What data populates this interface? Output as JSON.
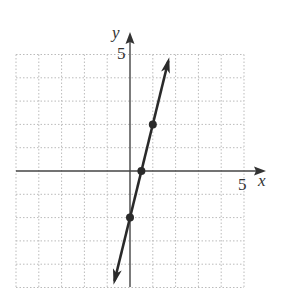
{
  "chart_data": {
    "type": "line",
    "title": "",
    "xlabel": "x",
    "ylabel": "y",
    "xlim": [
      -5,
      5
    ],
    "ylim": [
      -5,
      5
    ],
    "grid": true,
    "tick_labels": {
      "x": [
        "5"
      ],
      "y": [
        "5"
      ]
    },
    "equation": "y = 4x - 2",
    "series": [
      {
        "name": "line",
        "x": [
          0,
          0.5,
          1
        ],
        "y": [
          -2,
          0,
          2
        ],
        "marked_points": [
          [
            0,
            -2
          ],
          [
            0.5,
            0
          ],
          [
            1,
            2
          ]
        ],
        "arrows_both_ends": true
      }
    ],
    "colors": {
      "axis": "#444444",
      "grid": "#bbbbbb",
      "line": "#2a2a2a"
    }
  },
  "labels": {
    "x_axis": "x",
    "y_axis": "y",
    "x_tick": "5",
    "y_tick": "5"
  }
}
